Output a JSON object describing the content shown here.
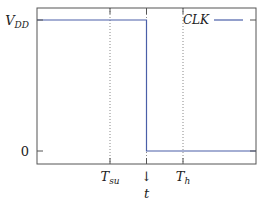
{
  "chart_data": {
    "type": "line",
    "title": "",
    "xlabel": "t",
    "ylabel": "",
    "xlim": [
      0,
      6
    ],
    "ylim": [
      -0.1,
      1.1
    ],
    "yticks": [
      {
        "value": 1,
        "label": "V",
        "sub": "DD"
      },
      {
        "value": 0,
        "label": "0",
        "sub": ""
      }
    ],
    "xticks": [
      {
        "value": 2,
        "label": "T",
        "sub": "su"
      },
      {
        "value": 3,
        "label": "↓",
        "sub": ""
      },
      {
        "value": 4,
        "label": "T",
        "sub": "h"
      }
    ],
    "xlabel_text": "t",
    "vlines": [
      2,
      3,
      4
    ],
    "series": [
      {
        "name": "CLK",
        "color": "#4a5fa8",
        "points": [
          [
            0,
            1
          ],
          [
            3,
            1
          ],
          [
            3,
            0
          ],
          [
            6,
            0
          ]
        ]
      }
    ],
    "legend": {
      "position": "top-right",
      "entries": [
        "CLK"
      ]
    },
    "grid": false
  }
}
